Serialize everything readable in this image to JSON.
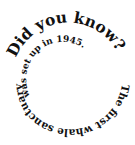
{
  "spiral": {
    "headline": "Did you know?",
    "outer_text": "The first whale sanctuary",
    "inner_text": "was set up in 1945.",
    "full_text": "Did you know? The first whale sanctuary was set up in 1945.",
    "text_color": "#111111",
    "background": "#ffffff"
  }
}
